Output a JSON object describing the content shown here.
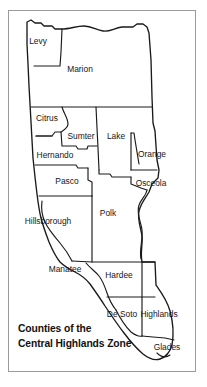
{
  "figure": {
    "title_line_1": "Counties of the",
    "title_line_2": "Central Highlands Zone",
    "frame_color": "#9a9a9a",
    "outline_color": "#1a1a1a",
    "background_color": "#ffffff",
    "label_color": "#161616"
  },
  "map": {
    "region_name": "Central Highlands Zone",
    "counties": [
      {
        "name": "Levy",
        "x": 38,
        "y": 42
      },
      {
        "name": "Marion",
        "x": 80,
        "y": 70
      },
      {
        "name": "Citrus",
        "x": 47,
        "y": 119
      },
      {
        "name": "Sumter",
        "x": 81,
        "y": 137
      },
      {
        "name": "Lake",
        "x": 116,
        "y": 137
      },
      {
        "name": "Hernando",
        "x": 55,
        "y": 156
      },
      {
        "name": "Orange",
        "x": 152,
        "y": 155
      },
      {
        "name": "Pasco",
        "x": 67,
        "y": 182
      },
      {
        "name": "Osceola",
        "x": 151,
        "y": 184
      },
      {
        "name": "Hillsborough",
        "x": 48,
        "y": 222
      },
      {
        "name": "Polk",
        "x": 108,
        "y": 214
      },
      {
        "name": "Manatee",
        "x": 65,
        "y": 270
      },
      {
        "name": "Hardee",
        "x": 119,
        "y": 276
      },
      {
        "name": "De Soto",
        "x": 122,
        "y": 315
      },
      {
        "name": "Highlands",
        "x": 159,
        "y": 315
      },
      {
        "name": "Glades",
        "x": 167,
        "y": 348
      }
    ]
  }
}
